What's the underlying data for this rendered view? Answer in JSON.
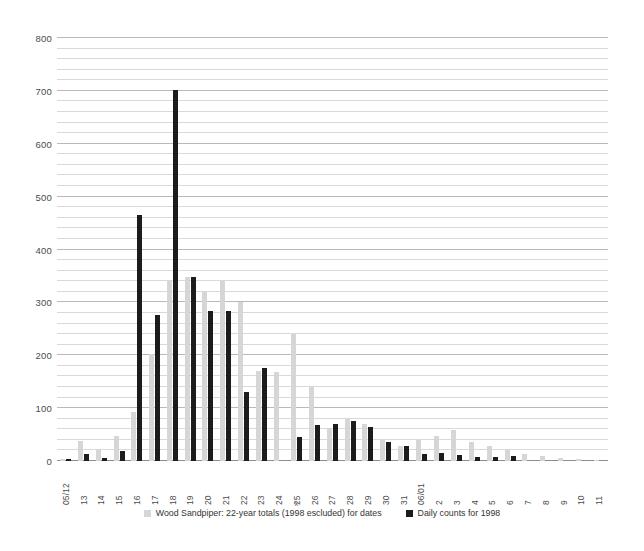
{
  "chart_data": {
    "type": "bar",
    "title": "",
    "xlabel": "",
    "ylabel": "",
    "ylim": [
      0,
      800
    ],
    "yticks": [
      0,
      100,
      200,
      300,
      400,
      500,
      600,
      700,
      800
    ],
    "minor_tick_step": 20,
    "grid": true,
    "legend_position": "bottom",
    "categories": [
      "05/12",
      "13",
      "14",
      "15",
      "16",
      "17",
      "18",
      "19",
      "20",
      "21",
      "22",
      "23",
      "24",
      "25",
      "26",
      "27",
      "28",
      "29",
      "30",
      "31",
      "06/01",
      "2",
      "3",
      "4",
      "5",
      "6",
      "7",
      "8",
      "9",
      "10",
      "11"
    ],
    "series": [
      {
        "name": "Wood Sandpiper: 22-year totals (1998 escluded) for dates",
        "color": "#d6d6d6",
        "values": [
          4,
          38,
          22,
          48,
          92,
          203,
          340,
          348,
          322,
          340,
          300,
          170,
          168,
          240,
          140,
          62,
          80,
          70,
          40,
          28,
          40,
          48,
          58,
          36,
          28,
          22,
          14,
          10,
          6,
          4,
          2
        ]
      },
      {
        "name": "Daily counts for 1998",
        "color": "#1c1c1c",
        "values": [
          4,
          14,
          6,
          18,
          465,
          276,
          702,
          348,
          284,
          284,
          130,
          176,
          0,
          46,
          68,
          70,
          76,
          64,
          36,
          28,
          14,
          16,
          12,
          8,
          8,
          10,
          0,
          0,
          0,
          0,
          0
        ]
      }
    ]
  },
  "legend": {
    "items": [
      {
        "label": "Wood Sandpiper: 22-year totals (1998 escluded) for dates",
        "swatch": "gray",
        "spellmark": "x"
      },
      {
        "label": "Daily counts for 1998",
        "swatch": "black",
        "spellmark": ""
      }
    ]
  }
}
